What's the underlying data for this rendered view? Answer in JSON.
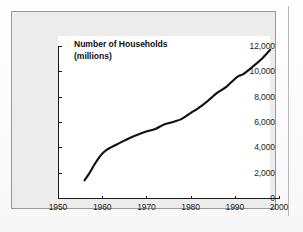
{
  "figure": {
    "title_line1": "Number of Households",
    "title_line2": "(millions)",
    "panel_color": "#ececed",
    "plot_color": "#ffffff",
    "border_color": "#9a9a9a",
    "axis_color": "#1a1a1a",
    "series_color": "#111111"
  },
  "chart_data": {
    "type": "line",
    "title": "Number of Households (millions)",
    "xlabel": "",
    "ylabel": "",
    "xlim": [
      1950,
      2000
    ],
    "ylim": [
      0,
      12000
    ],
    "grid": false,
    "legend": "none",
    "xticks": [
      1950,
      1960,
      1970,
      1980,
      1990,
      2000
    ],
    "xtick_labels": [
      "1950",
      "1960",
      "1970",
      "1980",
      "1990",
      "2000"
    ],
    "yticks": [
      0,
      2000,
      4000,
      6000,
      8000,
      10000,
      12000
    ],
    "ytick_labels": [
      "0",
      "2,000",
      "4,000",
      "6,000",
      "8,000",
      "10,000",
      "12,000"
    ],
    "series": [
      {
        "name": "Number of Households (millions)",
        "x": [
          1956,
          1957,
          1958,
          1959,
          1960,
          1961,
          1962,
          1964,
          1966,
          1968,
          1970,
          1972,
          1974,
          1976,
          1978,
          1980,
          1982,
          1984,
          1986,
          1988,
          1990,
          1991,
          1992,
          1994,
          1996,
          1998
        ],
        "values": [
          1400,
          1900,
          2500,
          3050,
          3500,
          3800,
          4000,
          4350,
          4700,
          5000,
          5250,
          5450,
          5800,
          6000,
          6250,
          6700,
          7150,
          7700,
          8300,
          8750,
          9400,
          9650,
          9800,
          10350,
          10950,
          11700
        ]
      }
    ]
  }
}
